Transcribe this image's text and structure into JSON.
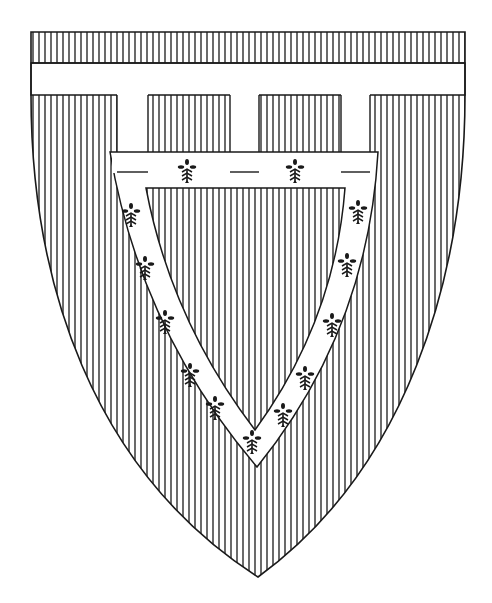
{
  "image": {
    "subject": "Heraldic shield",
    "description": "Shield hatched vertically (gules), with a label of three points and a bordure-like pall/chevron band charged with ermine spots",
    "colors": {
      "background": "#ffffff",
      "ink": "#1a1a1a",
      "argent": "#ffffff"
    },
    "hatch_spacing_px": 6
  },
  "shield": {
    "top": 32,
    "left": 31,
    "right": 465,
    "bottom_point_x": 258,
    "bottom_point_y": 577
  },
  "chief_band": {
    "top": 32,
    "bottom": 63
  },
  "label": {
    "bar_top": 63,
    "bar_bottom": 95,
    "pendants": [
      {
        "x1": 117,
        "x2": 148,
        "bottom": 172
      },
      {
        "x1": 230,
        "x2": 259,
        "bottom": 172
      },
      {
        "x1": 341,
        "x2": 370,
        "bottom": 172
      }
    ]
  },
  "charge_band": {
    "outer": [
      [
        110,
        152
      ],
      [
        378,
        152
      ],
      [
        257,
        467
      ]
    ],
    "inner": [
      [
        146,
        188
      ],
      [
        345,
        188
      ],
      [
        255,
        430
      ]
    ]
  },
  "ermine_spots": [
    {
      "x": 187,
      "y": 171
    },
    {
      "x": 295,
      "y": 171
    },
    {
      "x": 131,
      "y": 215
    },
    {
      "x": 145,
      "y": 268
    },
    {
      "x": 165,
      "y": 322
    },
    {
      "x": 190,
      "y": 375
    },
    {
      "x": 215,
      "y": 408
    },
    {
      "x": 252,
      "y": 442
    },
    {
      "x": 358,
      "y": 212
    },
    {
      "x": 347,
      "y": 265
    },
    {
      "x": 332,
      "y": 325
    },
    {
      "x": 305,
      "y": 378
    },
    {
      "x": 283,
      "y": 415
    }
  ],
  "caption": "Shield with label of three points and ermine charge"
}
